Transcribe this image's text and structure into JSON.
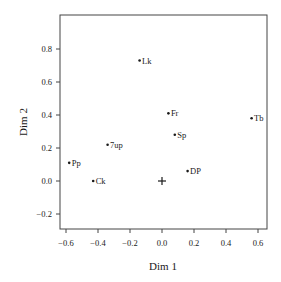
{
  "chart_data": {
    "type": "scatter",
    "title": "",
    "xlabel": "Dim 1",
    "ylabel": "Dim 2",
    "xlim": [
      -0.65,
      0.65
    ],
    "ylim": [
      -0.3,
      1.0
    ],
    "xticks": [
      -0.6,
      -0.4,
      -0.2,
      0.0,
      0.2,
      0.4,
      0.6
    ],
    "xtick_labels": [
      "−0.6",
      "−0.4",
      "−0.2",
      "0.0",
      "0.2",
      "0.4",
      "0.6"
    ],
    "yticks": [
      -0.2,
      0.0,
      0.2,
      0.4,
      0.6,
      0.8
    ],
    "ytick_labels": [
      "−0.2",
      "0.0",
      "0.2",
      "0.4",
      "0.6",
      "0.8"
    ],
    "grid": false,
    "legend": null,
    "points": [
      {
        "label": "Lk",
        "x": -0.14,
        "y": 0.73
      },
      {
        "label": "Fr",
        "x": 0.04,
        "y": 0.41
      },
      {
        "label": "Tb",
        "x": 0.56,
        "y": 0.38
      },
      {
        "label": "Sp",
        "x": 0.08,
        "y": 0.28
      },
      {
        "label": "7up",
        "x": -0.34,
        "y": 0.22
      },
      {
        "label": "Pp",
        "x": -0.58,
        "y": 0.11
      },
      {
        "label": "Ck",
        "x": -0.43,
        "y": 0.0
      },
      {
        "label": "DP",
        "x": 0.16,
        "y": 0.06
      }
    ],
    "origin_marker": {
      "symbol": "+",
      "x": 0.0,
      "y": 0.0
    }
  }
}
